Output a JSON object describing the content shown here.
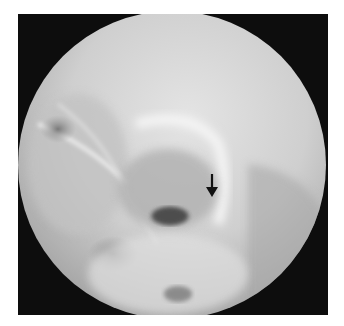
{
  "image": {
    "type": "radiograph",
    "description": "Circular-field X-ray of skull region with annotation arrow",
    "colors": {
      "background": "#ffffff",
      "frame": "#0d0d0d",
      "field_light": "#e6e6e6",
      "field_mid": "#b4b4b4",
      "field_dark": "#5a5a5a",
      "arrow": "#111111"
    }
  },
  "annotations": [
    {
      "type": "arrow",
      "direction": "down",
      "label": ""
    }
  ]
}
